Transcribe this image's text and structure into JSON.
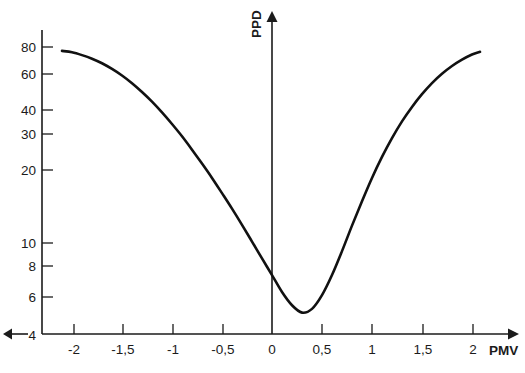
{
  "chart_data": {
    "type": "line",
    "title": "",
    "xlabel": "PMV",
    "ylabel": "PPD",
    "xlim": [
      -2.35,
      2.4
    ],
    "ylim": [
      4,
      90
    ],
    "yscale": "log",
    "grid": false,
    "legend": null,
    "x_tick_labels": [
      "-2",
      "-1,5",
      "-1",
      "-0,5",
      "0",
      "0,5",
      "1",
      "1,5",
      "2"
    ],
    "x_tick_values": [
      -2,
      -1.5,
      -1,
      -0.5,
      0,
      0.5,
      1,
      1.5,
      2
    ],
    "y_tick_labels": [
      "80",
      "60",
      "40",
      "30",
      "20",
      "10",
      "8",
      "6",
      "4"
    ],
    "y_tick_values": [
      80,
      60,
      40,
      30,
      20,
      10,
      8,
      6,
      4
    ],
    "series": [
      {
        "name": "PPD",
        "x": [
          -2.1,
          -2.0,
          -1.9,
          -1.8,
          -1.7,
          -1.6,
          -1.5,
          -1.4,
          -1.3,
          -1.2,
          -1.1,
          -1.0,
          -0.9,
          -0.8,
          -0.7,
          -0.6,
          -0.5,
          -0.4,
          -0.3,
          -0.2,
          -0.1,
          0.0,
          0.1,
          0.2,
          0.3,
          0.4,
          0.5,
          0.6,
          0.7,
          0.8,
          0.9,
          1.0,
          1.1,
          1.2,
          1.3,
          1.4,
          1.5,
          1.6,
          1.7,
          1.8,
          1.9,
          2.0,
          2.08
        ],
        "y": [
          76.8,
          75.7,
          73.5,
          70.8,
          67.5,
          63.6,
          59.4,
          54.8,
          50.0,
          45.2,
          40.4,
          35.8,
          31.5,
          27.4,
          23.7,
          20.4,
          17.4,
          14.8,
          12.5,
          10.5,
          8.8,
          7.4,
          6.2,
          5.4,
          5.0,
          5.2,
          6.0,
          7.4,
          9.5,
          12.4,
          16.0,
          20.4,
          25.4,
          30.9,
          36.8,
          42.8,
          48.9,
          54.9,
          60.5,
          65.6,
          70.1,
          74.0,
          76.1
        ]
      }
    ],
    "annotations": {
      "minimum": {
        "x": 0,
        "y": 5,
        "description": "PPD minimum of 5% at PMV = 0"
      },
      "x_axis_arrow": "right",
      "y_axis_arrow": "up",
      "baseline_arrow": "left"
    }
  },
  "axis_titles": {
    "y": "PPD",
    "x": "PMV"
  },
  "colors": {
    "curve": "#111111",
    "axis": "#1b1b1b",
    "background": "#ffffff",
    "text": "#1b1b1b"
  }
}
